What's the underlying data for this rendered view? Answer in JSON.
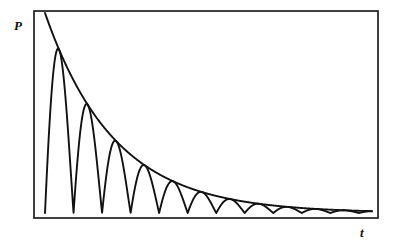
{
  "figure": {
    "labels": {
      "y_axis": "P",
      "x_axis": "t"
    },
    "frame": {
      "x": 34,
      "y": 11,
      "width": 344,
      "height": 207,
      "stroke_color": "#111111",
      "stroke_width": 1.6,
      "fill_color": "#ffffff"
    },
    "curve_color": "#111111",
    "envelope_color": "#111111"
  },
  "chart_data": {
    "type": "line",
    "title": "",
    "subtitle": "",
    "xlabel": "t",
    "ylabel": "P",
    "xlim": [
      0,
      10
    ],
    "ylim": [
      0,
      1
    ],
    "grid": false,
    "legend": "none",
    "annotations": [],
    "model": {
      "envelope_formula": "P = A * exp(-k * t)",
      "oscillation_formula": "P = A * exp(-k * t) * |sin(w * t)|",
      "amplitude_A": 1.0,
      "decay_k": 0.47,
      "angular_frequency_w": 3.6,
      "oscillation_period": 1.745,
      "visible_peak_count": 9
    },
    "series": [
      {
        "name": "envelope",
        "x": [
          0.0,
          0.5,
          1.0,
          1.5,
          2.0,
          2.5,
          3.0,
          3.5,
          4.0,
          4.5,
          5.0,
          5.5,
          6.0,
          6.5,
          7.0,
          7.5,
          8.0,
          8.5,
          9.0,
          9.5,
          10.0
        ],
        "y": [
          1.0,
          0.79,
          0.625,
          0.494,
          0.391,
          0.309,
          0.244,
          0.193,
          0.153,
          0.121,
          0.095,
          0.075,
          0.06,
          0.047,
          0.037,
          0.029,
          0.023,
          0.018,
          0.015,
          0.012,
          0.009
        ]
      },
      {
        "name": "damped-oscillation",
        "x_peaks": [
          0.436,
          2.182,
          3.927,
          5.672,
          7.418,
          9.163,
          10.908,
          12.654,
          14.399
        ],
        "y_peaks": [
          0.815,
          0.359,
          0.158,
          0.07,
          0.031,
          0.013,
          0.006,
          0.003,
          0.001
        ],
        "x_minima": [
          0.0,
          1.745,
          3.491,
          5.236,
          6.981,
          8.727,
          10.472,
          12.217,
          13.963
        ],
        "y_minima": [
          0.0,
          0.0,
          0.0,
          0.0,
          0.0,
          0.0,
          0.0,
          0.0,
          0.0
        ]
      }
    ]
  }
}
